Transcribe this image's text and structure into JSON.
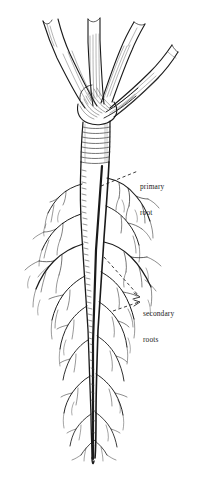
{
  "figure": {
    "background_color": "#ffffff",
    "ink_color": "#1a1a1a",
    "style": "pen-and-ink line engraving",
    "width": 199,
    "height": 479
  },
  "labels": {
    "primary_root": {
      "line1": "primary",
      "line2": "root",
      "x": 140,
      "y": 166
    },
    "secondary_roots": {
      "line1": "secondary",
      "line2": "roots",
      "x": 143,
      "y": 293
    }
  },
  "leaders": [
    {
      "name": "primary-root-leader",
      "from_x": 101,
      "from_y": 186,
      "to_x": 138,
      "to_y": 171,
      "arrow": false
    },
    {
      "name": "secondary-roots-leader-upper",
      "from_x": 104,
      "from_y": 257,
      "to_x": 140,
      "to_y": 297,
      "arrow": true
    },
    {
      "name": "secondary-roots-leader-lower",
      "from_x": 113,
      "from_y": 311,
      "to_x": 140,
      "to_y": 303,
      "arrow": true
    }
  ],
  "anatomy": {
    "crown": {
      "label": "leaf crown / petiole bases",
      "top": 18,
      "bottom": 112
    },
    "petiole_count": 5,
    "taproot": {
      "label": "primary root (taproot)",
      "top": 112,
      "bottom": 462
    },
    "secondary_root_zone": {
      "top": 175,
      "bottom": 455
    }
  },
  "colors": {
    "ink": "#1a1a1a",
    "ink_light": "#4a4a4a",
    "hatch": "#5a5a5a",
    "paper": "#ffffff"
  }
}
